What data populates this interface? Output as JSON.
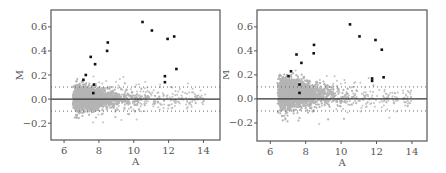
{
  "chart_data": [
    {
      "type": "scatter",
      "title": "",
      "xlabel": "A",
      "ylabel": "M",
      "xlim": [
        5.25,
        14.95
      ],
      "ylim": [
        -0.34,
        0.74
      ],
      "xticks": [
        6,
        8,
        10,
        12,
        14
      ],
      "xtick_labels": [
        "6",
        "8",
        "10",
        "12",
        "14"
      ],
      "yticks": [
        -0.2,
        0.0,
        0.2,
        0.4,
        0.6
      ],
      "ytick_labels": [
        "−0.2",
        "0.0",
        "0.2",
        "0.4",
        "0.6"
      ],
      "grid": false,
      "legend": null,
      "reference_lines": [
        {
          "y": 0.0,
          "style": "solid",
          "color": "#333333"
        },
        {
          "y": 0.1,
          "style": "dotted",
          "color": "#666666"
        },
        {
          "y": -0.1,
          "style": "dotted",
          "color": "#666666"
        }
      ],
      "series": [
        {
          "name": "highlighted genes",
          "color": "#111111",
          "marker": "filled-square",
          "points": [
            {
              "A": 8.51,
              "M": 0.47
            },
            {
              "A": 8.47,
              "M": 0.4
            },
            {
              "A": 7.53,
              "M": 0.35
            },
            {
              "A": 7.78,
              "M": 0.29
            },
            {
              "A": 7.25,
              "M": 0.2
            },
            {
              "A": 7.11,
              "M": 0.16
            },
            {
              "A": 7.71,
              "M": 0.12
            },
            {
              "A": 7.68,
              "M": 0.05
            },
            {
              "A": 10.5,
              "M": 0.64
            },
            {
              "A": 11.04,
              "M": 0.57
            },
            {
              "A": 11.94,
              "M": 0.5
            },
            {
              "A": 12.32,
              "M": 0.52
            },
            {
              "A": 12.45,
              "M": 0.25
            },
            {
              "A": 11.79,
              "M": 0.19
            },
            {
              "A": 11.79,
              "M": 0.14
            }
          ]
        },
        {
          "name": "all genes",
          "color": "#b4b4b4",
          "marker": "small-circle",
          "cloud": {
            "seed": 11,
            "n_dense": 2600,
            "n_sparse": 260,
            "a_min": 6.5,
            "a_peak": 7.5,
            "a_max": 14.3,
            "m_center_start": 0.01,
            "m_center_end": 0.0,
            "m_spread_start": 0.045,
            "m_spread_end": 0.015,
            "tail_down": 0.06
          }
        }
      ]
    },
    {
      "type": "scatter",
      "title": "",
      "xlabel": "A",
      "ylabel": "M",
      "xlim": [
        5.25,
        14.85
      ],
      "ylim": [
        -0.35,
        0.74
      ],
      "xticks": [
        6,
        8,
        10,
        12,
        14
      ],
      "xtick_labels": [
        "6",
        "8",
        "10",
        "12",
        "14"
      ],
      "yticks": [
        -0.2,
        0.0,
        0.2,
        0.4,
        0.6
      ],
      "ytick_labels": [
        "−0.2",
        "0.0",
        "0.2",
        "0.4",
        "0.6"
      ],
      "grid": false,
      "legend": null,
      "reference_lines": [
        {
          "y": 0.0,
          "style": "solid",
          "color": "#333333"
        },
        {
          "y": 0.1,
          "style": "dotted",
          "color": "#666666"
        },
        {
          "y": -0.1,
          "style": "dotted",
          "color": "#666666"
        }
      ],
      "series": [
        {
          "name": "highlighted genes",
          "color": "#111111",
          "marker": "filled-square",
          "points": [
            {
              "A": 8.47,
              "M": 0.45
            },
            {
              "A": 8.45,
              "M": 0.38
            },
            {
              "A": 7.48,
              "M": 0.37
            },
            {
              "A": 7.76,
              "M": 0.3
            },
            {
              "A": 7.17,
              "M": 0.23
            },
            {
              "A": 7.03,
              "M": 0.19
            },
            {
              "A": 7.65,
              "M": 0.12
            },
            {
              "A": 7.65,
              "M": 0.05
            },
            {
              "A": 10.5,
              "M": 0.62
            },
            {
              "A": 11.04,
              "M": 0.52
            },
            {
              "A": 11.94,
              "M": 0.49
            },
            {
              "A": 12.3,
              "M": 0.41
            },
            {
              "A": 12.4,
              "M": 0.18
            },
            {
              "A": 11.75,
              "M": 0.17
            },
            {
              "A": 11.75,
              "M": 0.15
            }
          ]
        },
        {
          "name": "all genes",
          "color": "#b4b4b4",
          "marker": "small-circle",
          "cloud": {
            "seed": 29,
            "n_dense": 2800,
            "n_sparse": 280,
            "a_min": 6.4,
            "a_peak": 7.0,
            "a_max": 14.2,
            "m_center_start": 0.06,
            "m_center_end": -0.02,
            "m_spread_start": 0.055,
            "m_spread_end": 0.02,
            "tail_down": 0.07
          }
        }
      ]
    }
  ],
  "layout": {
    "panels": [
      {
        "left": 0,
        "plot_x": 51,
        "plot_y": 10,
        "plot_w": 169,
        "plot_h": 130
      },
      {
        "left": 223,
        "plot_x": 34,
        "plot_y": 10,
        "plot_w": 170,
        "plot_h": 131
      }
    ]
  }
}
